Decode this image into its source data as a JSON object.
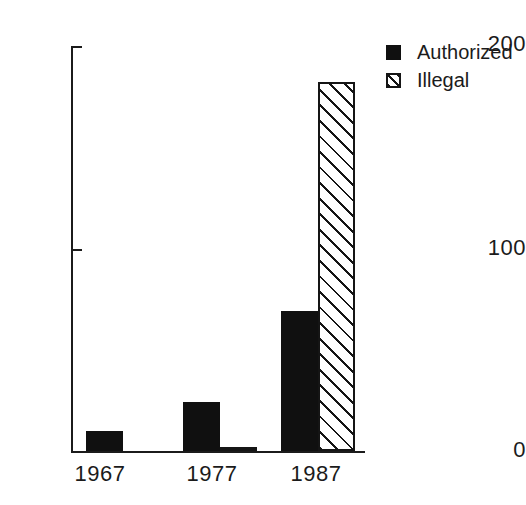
{
  "chart_data": {
    "type": "bar",
    "title": "",
    "subtitle": "",
    "xlabel": "",
    "ylabel": "",
    "categories": [
      "1967",
      "1977",
      "1987"
    ],
    "series": [
      {
        "name": "Authorized",
        "values": [
          10,
          24,
          69
        ],
        "fill": "solid-black"
      },
      {
        "name": "Illegal",
        "values": [
          0,
          2,
          182
        ],
        "fill": "diagonal-hatch"
      }
    ],
    "ylim": [
      0,
      200
    ],
    "yticks": [
      0,
      100,
      200
    ],
    "ytick_labels": [
      "0",
      "100",
      "200"
    ],
    "grid": false,
    "legend_position": "top-right",
    "annotations": []
  },
  "axis": {
    "y_labels": {
      "top": "200",
      "mid": "100",
      "bottom": "0"
    },
    "x_labels": [
      "1967",
      "1977",
      "1987"
    ]
  },
  "legend": {
    "items": [
      {
        "label": "Authorized",
        "swatch": "solid-black-square-icon"
      },
      {
        "label": "Illegal",
        "swatch": "hatched-square-icon"
      }
    ]
  },
  "colors": {
    "ink": "#1b1b1b",
    "bar_fill": "#101010",
    "hatch_line": "#151515",
    "background": "#ffffff"
  }
}
